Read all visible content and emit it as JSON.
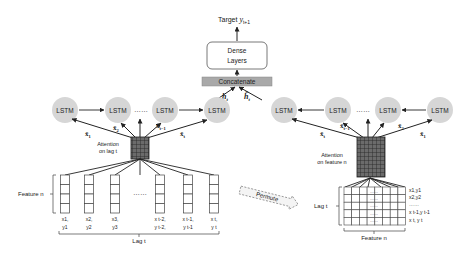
{
  "target": {
    "prefix": "Target ",
    "var": "y",
    "sub": "t+1"
  },
  "dense": {
    "line1": "Dense",
    "line2": "Layers"
  },
  "concat": {
    "label": "Concatenate"
  },
  "left": {
    "hidden": {
      "var": "h",
      "sub": "t"
    },
    "lstm_label": "LSTM",
    "ellipsis": "……",
    "inputs": [
      {
        "var": "x̃",
        "sub": "1"
      },
      {
        "var": "x̃",
        "sub": "2"
      },
      {
        "var": "x̃",
        "sub": "t−1"
      },
      {
        "var": "x̃",
        "sub": "t"
      }
    ],
    "attention": {
      "line1": "Attention",
      "line2": "on lag t"
    },
    "feature_label": "Feature n",
    "lag_label": "Lag t",
    "columns": [
      {
        "l1": "x1,",
        "l2": "y1"
      },
      {
        "l1": "x2,",
        "l2": "y2"
      },
      {
        "l1": "x3,",
        "l2": "y3"
      },
      {
        "l1": "x t-2,",
        "l2": "y t-2,"
      },
      {
        "l1": "x t-1,",
        "l2": "y t-1"
      },
      {
        "l1": "x t,",
        "l2": "y t"
      }
    ],
    "col_ellipsis": "……"
  },
  "right": {
    "hidden": {
      "var": "h̃",
      "sub": "t"
    },
    "lstm_label": "LSTM",
    "ellipsis": "……",
    "inputs": [
      {
        "var": "x̃",
        "sub": "t"
      },
      {
        "var": "x̃",
        "sub": "t−1"
      },
      {
        "var": "x̃",
        "sub": "2"
      },
      {
        "var": "x̃",
        "sub": "1"
      }
    ],
    "attention": {
      "line1": "Attention",
      "line2": "on feature n"
    },
    "lag_label": "Lag t",
    "feature_label": "Feature n",
    "rows": [
      "x1,y1",
      "x2,y2",
      "……",
      "x t-1,y t-1",
      "x t, y t"
    ],
    "cell_ellipsis": "……"
  },
  "permute": {
    "label": "Permute"
  }
}
